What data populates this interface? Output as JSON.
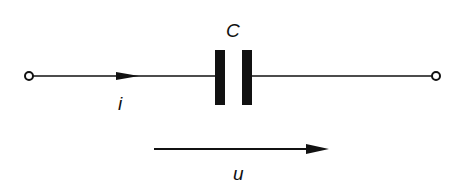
{
  "diagram": {
    "type": "circuit",
    "component": "capacitor",
    "labels": {
      "capacitor": "C",
      "current": "i",
      "voltage": "u"
    },
    "colors": {
      "stroke": "#111111",
      "background": "#ffffff"
    }
  }
}
